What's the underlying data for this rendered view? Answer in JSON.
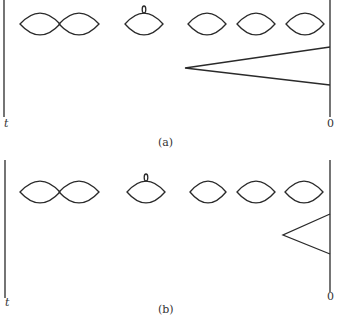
{
  "figure": {
    "panels": [
      {
        "id": "a",
        "caption": "(a)",
        "left_axis_label": "t",
        "right_axis_label": "0",
        "lenses": [
          {
            "cx": 40,
            "cy": 24,
            "rx": 20,
            "ry": 11,
            "loop": false
          },
          {
            "cx": 79,
            "cy": 24,
            "rx": 20,
            "ry": 11,
            "loop": false
          },
          {
            "cx": 144,
            "cy": 24,
            "rx": 19,
            "ry": 11,
            "loop": true
          },
          {
            "cx": 207,
            "cy": 24,
            "rx": 19,
            "ry": 11,
            "loop": false
          },
          {
            "cx": 256,
            "cy": 24,
            "rx": 19,
            "ry": 11,
            "loop": false
          },
          {
            "cx": 305,
            "cy": 24,
            "rx": 19,
            "ry": 11,
            "loop": false
          }
        ],
        "triangle": {
          "apex": [
            185,
            68
          ],
          "top": [
            330,
            47
          ],
          "bottom": [
            330,
            85
          ]
        }
      },
      {
        "id": "b",
        "caption": "(b)",
        "left_axis_label": "t",
        "right_axis_label": "0",
        "lenses": [
          {
            "cx": 40,
            "cy": 192,
            "rx": 20,
            "ry": 11,
            "loop": false
          },
          {
            "cx": 79,
            "cy": 192,
            "rx": 20,
            "ry": 11,
            "loop": false
          },
          {
            "cx": 146,
            "cy": 192,
            "rx": 19,
            "ry": 11,
            "loop": true
          },
          {
            "cx": 208,
            "cy": 192,
            "rx": 18,
            "ry": 11,
            "loop": false
          },
          {
            "cx": 256,
            "cy": 192,
            "rx": 19,
            "ry": 11,
            "loop": false
          },
          {
            "cx": 304,
            "cy": 192,
            "rx": 19,
            "ry": 11,
            "loop": false
          }
        ],
        "triangle": {
          "apex": [
            283,
            235
          ],
          "top": [
            330,
            214
          ],
          "bottom": [
            330,
            254
          ]
        }
      }
    ]
  }
}
